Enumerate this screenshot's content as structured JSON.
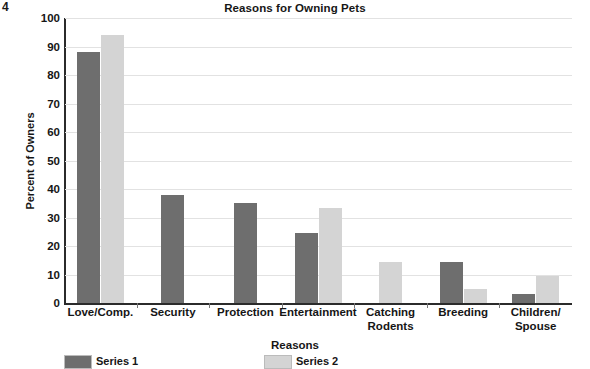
{
  "page_marker": "4",
  "chart_data": {
    "type": "bar",
    "title": "Reasons for Owning Pets",
    "xlabel": "Reasons",
    "ylabel": "Percent of Owners",
    "ylim": [
      0,
      100
    ],
    "ytick_step": 10,
    "yticks": [
      100,
      90,
      80,
      70,
      60,
      50,
      40,
      30,
      20,
      10,
      0
    ],
    "grid": true,
    "legend_position": "bottom-left",
    "categories": [
      "Love/Comp.",
      "Security",
      "Protection",
      "Entertainment",
      "Catching\nRodents",
      "Breeding",
      "Children/\nSpouse"
    ],
    "series": [
      {
        "name": "Series 1",
        "color": "#6e6e6e",
        "values": [
          88,
          38,
          35,
          24.5,
          0,
          14.5,
          3
        ]
      },
      {
        "name": "Series 2",
        "color": "#d4d4d4",
        "values": [
          94,
          0,
          0,
          33.5,
          14.5,
          5,
          9.5
        ]
      }
    ]
  },
  "colors": {
    "series_dark": "#6e6e6e",
    "series_light": "#d4d4d4",
    "axis": "#2b2b2b",
    "grid": "#e2e2e2",
    "text": "#161616",
    "background": "#ffffff"
  }
}
